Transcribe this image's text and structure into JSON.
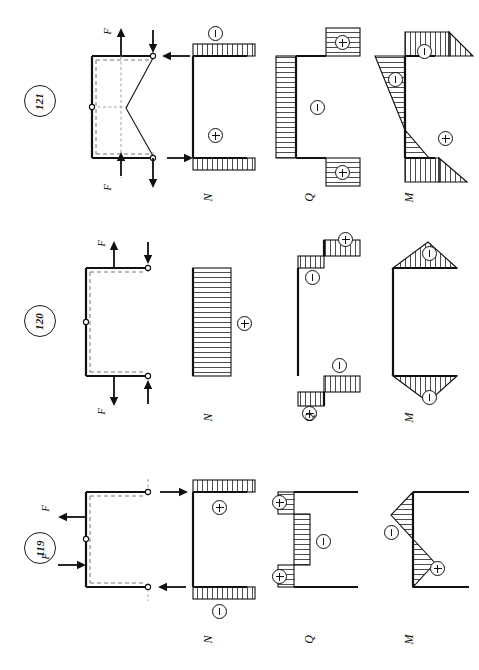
{
  "figure": {
    "kind": "structural-mechanics-internal-force-diagrams",
    "orientation_note": "page content rotated 90 degrees",
    "diagram_captions": {
      "normal": "N",
      "shear": "Q",
      "moment": "M"
    },
    "sign_symbols": {
      "positive": "+",
      "negative": "−"
    },
    "force_label": "F"
  },
  "problems": [
    {
      "number": "121",
      "load_labels": [
        "F",
        "F"
      ],
      "captions": {
        "normal": "N",
        "shear": "Q",
        "moment": "M"
      },
      "normal_diagram": {
        "caption": "N",
        "signs": [
          "−",
          "+"
        ],
        "regions": [
          {
            "member": "top-beam",
            "sign": "−",
            "shape": "uniform-band"
          },
          {
            "member": "bottom-beam",
            "sign": "+",
            "shape": "uniform-band"
          }
        ]
      },
      "shear_diagram": {
        "caption": "Q",
        "signs": [
          "+",
          "−",
          "+"
        ],
        "regions": [
          {
            "member": "top-beam",
            "sign": "+",
            "shape": "uniform-block"
          },
          {
            "member": "column",
            "sign": "−",
            "shape": "uniform-band"
          },
          {
            "member": "bottom-beam",
            "sign": "+",
            "shape": "uniform-block"
          }
        ]
      },
      "moment_diagram": {
        "caption": "M",
        "signs": [
          "−",
          "−",
          "+"
        ],
        "regions": [
          {
            "member": "top-beam",
            "sign": "−",
            "shape": "triangular"
          },
          {
            "member": "column",
            "sign": "−",
            "shape": "linear-varying"
          },
          {
            "member": "bottom-beam",
            "sign": "+",
            "shape": "triangular"
          }
        ]
      }
    },
    {
      "number": "120",
      "load_labels": [
        "F",
        "F"
      ],
      "captions": {
        "normal": "N",
        "shear": "Q",
        "moment": "M"
      },
      "normal_diagram": {
        "caption": "N",
        "signs": [
          "+"
        ],
        "regions": [
          {
            "member": "column",
            "sign": "+",
            "shape": "uniform-band"
          }
        ]
      },
      "shear_diagram": {
        "caption": "Q",
        "signs": [
          "+",
          "−",
          "−",
          "+"
        ],
        "regions": [
          {
            "member": "top-beam-outer",
            "sign": "+",
            "shape": "uniform-block"
          },
          {
            "member": "top-beam-inner",
            "sign": "−",
            "shape": "uniform-block"
          },
          {
            "member": "bottom-beam-inner",
            "sign": "−",
            "shape": "uniform-block"
          },
          {
            "member": "bottom-beam-outer",
            "sign": "+",
            "shape": "uniform-block"
          }
        ]
      },
      "moment_diagram": {
        "caption": "M",
        "signs": [
          "−",
          "−"
        ],
        "regions": [
          {
            "member": "top-beam",
            "sign": "−",
            "shape": "triangular-peak"
          },
          {
            "member": "bottom-beam",
            "sign": "−",
            "shape": "triangular-peak"
          }
        ]
      }
    },
    {
      "number": "119",
      "load_labels": [
        "F",
        "F"
      ],
      "captions": {
        "normal": "N",
        "shear": "Q",
        "moment": "M"
      },
      "normal_diagram": {
        "caption": "N",
        "signs": [
          "+",
          "−"
        ],
        "regions": [
          {
            "member": "top-beam",
            "sign": "+",
            "shape": "uniform-band"
          },
          {
            "member": "bottom-beam",
            "sign": "−",
            "shape": "uniform-band"
          }
        ]
      },
      "shear_diagram": {
        "caption": "Q",
        "signs": [
          "+",
          "−",
          "+"
        ],
        "regions": [
          {
            "member": "top-beam",
            "sign": "+",
            "shape": "uniform-block"
          },
          {
            "member": "column",
            "sign": "−",
            "shape": "uniform-band"
          },
          {
            "member": "bottom-beam",
            "sign": "+",
            "shape": "uniform-block"
          }
        ]
      },
      "moment_diagram": {
        "caption": "M",
        "signs": [
          "−",
          "+"
        ],
        "regions": [
          {
            "member": "upper-column",
            "sign": "−",
            "shape": "triangular"
          },
          {
            "member": "lower-column",
            "sign": "+",
            "shape": "triangular"
          }
        ]
      }
    }
  ]
}
